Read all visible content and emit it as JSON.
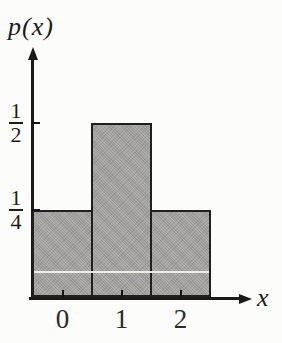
{
  "chart_data": {
    "type": "bar",
    "title": "",
    "ylabel": "p(x)",
    "xlabel": "x",
    "x": [
      0,
      1,
      2
    ],
    "x_tick_labels": [
      "0",
      "1",
      "2"
    ],
    "values": [
      0.25,
      0.5,
      0.25
    ],
    "bar_width": 1.0,
    "xlim": [
      -0.5,
      3.2
    ],
    "ylim": [
      0,
      0.6
    ],
    "grid": false,
    "legend": "none",
    "y_ticks": [
      {
        "value": 0.5,
        "numerator": "1",
        "denominator": "2"
      },
      {
        "value": 0.25,
        "numerator": "1",
        "denominator": "4"
      }
    ],
    "colors": {
      "background": "#fcfcfb",
      "bar_fill": "#a7a6a3",
      "bar_edge": "#1f1f1f",
      "axis": "#1a1a1a",
      "text": "#1c1c1c",
      "scan_line": "#f3f2ea"
    }
  }
}
